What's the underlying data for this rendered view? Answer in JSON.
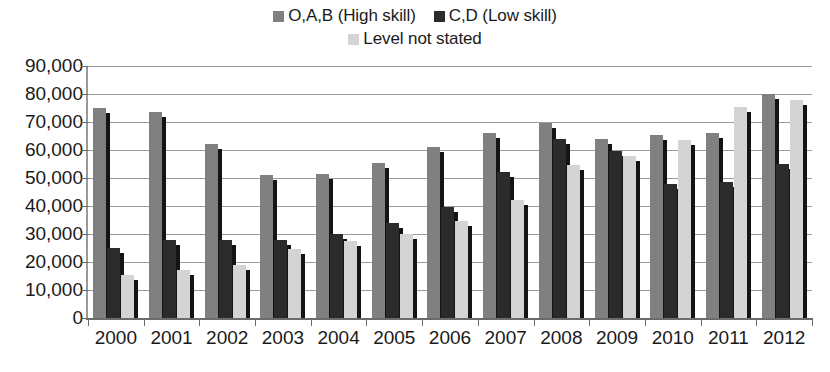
{
  "chart_data": {
    "type": "bar",
    "title": "",
    "subtitle": "",
    "xlabel": "",
    "ylabel": "",
    "grid": true,
    "legend_position": "top-center",
    "ylim": [
      0,
      90000
    ],
    "ytick_labels": [
      "90,000",
      "80,000",
      "70,000",
      "60,000",
      "50,000",
      "40,000",
      "30,000",
      "20,000",
      "10,000",
      "0"
    ],
    "ytick_values": [
      90000,
      80000,
      70000,
      60000,
      50000,
      40000,
      30000,
      20000,
      10000,
      0
    ],
    "categories": [
      "2000",
      "2001",
      "2002",
      "2003",
      "2004",
      "2005",
      "2006",
      "2007",
      "2008",
      "2009",
      "2010",
      "2011",
      "2012"
    ],
    "series": [
      {
        "name": "O,A,B (High skill)",
        "color": "#808080",
        "values": [
          75000,
          73500,
          62000,
          51000,
          51500,
          55500,
          61000,
          66000,
          69500,
          64000,
          65500,
          66000,
          80000
        ]
      },
      {
        "name": "C,D (Low skill)",
        "color": "#2b2b2b",
        "values": [
          25000,
          28000,
          28000,
          28000,
          30000,
          34000,
          39500,
          52000,
          64000,
          59500,
          48000,
          48500,
          55000
        ]
      },
      {
        "name": "Level not stated",
        "color": "#d4d4d4",
        "values": [
          15500,
          17000,
          19000,
          24500,
          27500,
          30000,
          34500,
          42000,
          54500,
          58000,
          63500,
          75500,
          78000
        ]
      }
    ]
  },
  "legend": {
    "rows": [
      [
        {
          "label": "O,A,B (High skill)",
          "color": "#808080",
          "icon": "legend-swatch-icon"
        },
        {
          "label": "C,D (Low skill)",
          "color": "#2b2b2b",
          "icon": "legend-swatch-icon"
        }
      ],
      [
        {
          "label": "Level not stated",
          "color": "#d4d4d4",
          "icon": "legend-swatch-icon"
        }
      ]
    ]
  }
}
